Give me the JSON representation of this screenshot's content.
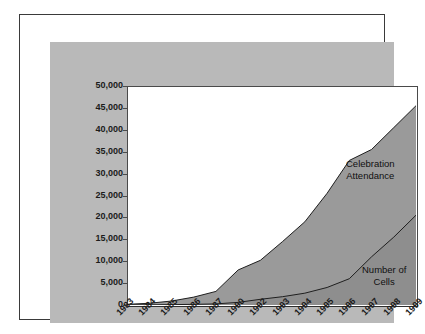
{
  "chart_data": {
    "type": "area",
    "title": "",
    "subtitle": "",
    "xlabel": "",
    "ylabel": "",
    "stacked": false,
    "grid": false,
    "legend_position": "inline-annotations",
    "ylim": [
      0,
      50000
    ],
    "ytick_labels": [
      "50,000",
      "45,000",
      "40,000",
      "35,000",
      "30,000",
      "25,000",
      "20,000",
      "15,000",
      "10,000",
      "5,000",
      "0"
    ],
    "ytick_values": [
      50000,
      45000,
      40000,
      35000,
      30000,
      25000,
      20000,
      15000,
      10000,
      5000,
      0
    ],
    "categories": [
      "1983",
      "1984",
      "1985",
      "1986",
      "1987",
      "1990",
      "1992",
      "1993",
      "1994",
      "1995",
      "1996",
      "1997",
      "1998",
      "1999"
    ],
    "series": [
      {
        "name": "Celebration Attendance",
        "fill": "#9a9a9a",
        "line": "#1f1f1f",
        "values": [
          150,
          400,
          900,
          1800,
          3100,
          8000,
          10200,
          14500,
          19000,
          25500,
          33000,
          35500,
          40500,
          45500
        ]
      },
      {
        "name": "Number of Cells",
        "fill": "#8e8e8e",
        "line": "#1f1f1f",
        "values": [
          20,
          40,
          80,
          150,
          250,
          600,
          1300,
          1900,
          2700,
          4000,
          6000,
          11000,
          15500,
          20500
        ]
      }
    ],
    "annotations": [
      {
        "name": "celebration-attendance",
        "line1": "Celebration",
        "line2": "Attendance"
      },
      {
        "name": "number-of-cells",
        "line1": "Number of",
        "line2": "Cells"
      }
    ]
  },
  "colors": {
    "page_background": "#ffffff",
    "frame_border": "#3a3a3a",
    "panel_background": "#b9b9b9",
    "plot_background": "#ffffff",
    "axis_line": "#4a4a4a",
    "upper_area_fill": "#9a9a9a",
    "lower_area_fill": "#8e8e8e",
    "series_line": "#1f1f1f",
    "tick_label": "#1b1b1b"
  }
}
